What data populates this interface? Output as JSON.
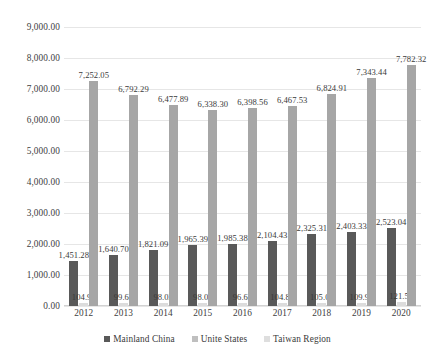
{
  "chart_data": {
    "type": "bar",
    "title": "",
    "subtitle": "",
    "xlabel": "",
    "ylabel": "",
    "categories": [
      "2012",
      "2013",
      "2014",
      "2015",
      "2016",
      "2017",
      "2018",
      "2019",
      "2020"
    ],
    "ylim": [
      0,
      9000
    ],
    "ytick_values": [
      0,
      1000,
      2000,
      3000,
      4000,
      5000,
      6000,
      7000,
      8000,
      9000
    ],
    "ytick_labels": [
      "0.00",
      "1,000.00",
      "2,000.00",
      "3,000.00",
      "4,000.00",
      "5,000.00",
      "6,000.00",
      "7,000.00",
      "8,000.00",
      "9,000.00"
    ],
    "grid": true,
    "legend_position": "bottom",
    "series": [
      {
        "name": "Mainland China",
        "color": "#595959",
        "values": [
          1451.28,
          1640.7,
          1821.09,
          1965.39,
          1985.38,
          2104.43,
          2325.31,
          2403.33,
          2523.04
        ],
        "labels": [
          "1,451.28",
          "1,640.70",
          "1,821.09",
          "1,965.39",
          "1,985.38",
          "2,104.43",
          "2,325.31",
          "2,403.33",
          "2,523.04"
        ]
      },
      {
        "name": "Unite States",
        "color": "#dcdcdc",
        "values": [
          104.97,
          99.64,
          98.02,
          98.03,
          96.64,
          104.8,
          105.05,
          109.93,
          121.55
        ],
        "labels": [
          "104.97",
          "99.64",
          "98.02",
          "98.03",
          "96.64",
          "104.80",
          "105.05",
          "109.93",
          "121.55"
        ]
      },
      {
        "name": "Taiwan Region",
        "color": "#a6a6a6",
        "values": [
          7252.05,
          6792.29,
          6477.89,
          6338.3,
          6398.56,
          6467.53,
          6824.91,
          7343.44,
          7782.32
        ],
        "labels": [
          "7,252.05",
          "6,792.29",
          "6,477.89",
          "6,338.30",
          "6,398.56",
          "6,467.53",
          "6,824.91",
          "7,343.44",
          "7,782.32"
        ]
      }
    ]
  },
  "legend": {
    "items": [
      {
        "label": "Mainland China",
        "key": "china"
      },
      {
        "label": "Unite States",
        "key": "usa"
      },
      {
        "label": "Taiwan Region",
        "key": "taiwan"
      }
    ]
  }
}
